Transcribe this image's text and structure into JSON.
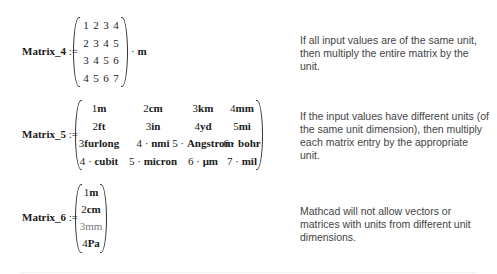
{
  "matrix4": {
    "name": "Matrix_4",
    "assign": ":=",
    "rows": [
      [
        "1",
        "2",
        "3",
        "4"
      ],
      [
        "2",
        "3",
        "4",
        "5"
      ],
      [
        "3",
        "4",
        "5",
        "6"
      ],
      [
        "4",
        "5",
        "6",
        "7"
      ]
    ],
    "suffix_op": "·",
    "suffix_unit": "m",
    "note": "If all input values are of the same unit, then multiply the entire matrix by the unit."
  },
  "matrix5": {
    "name": "Matrix_5",
    "assign": ":=",
    "rows": [
      [
        {
          "n": "1",
          "u": "m"
        },
        {
          "n": "2",
          "u": "cm"
        },
        {
          "n": "3",
          "u": "km"
        },
        {
          "n": "4",
          "u": "mm"
        }
      ],
      [
        {
          "n": "2",
          "u": "ft"
        },
        {
          "n": "3",
          "u": "in"
        },
        {
          "n": "4",
          "u": "yd"
        },
        {
          "n": "5",
          "u": "mi"
        }
      ],
      [
        {
          "n": "3",
          "u": "furlong"
        },
        {
          "n": "4 · ",
          "u": "nmi"
        },
        {
          "n": "5 · ",
          "u": "Angstrom"
        },
        {
          "n": "6 · ",
          "u": "bohr"
        }
      ],
      [
        {
          "n": "4 · ",
          "u": "cubit"
        },
        {
          "n": "5 · ",
          "u": "micron"
        },
        {
          "n": "6 · ",
          "u": "μm"
        },
        {
          "n": "7 · ",
          "u": "mil"
        }
      ]
    ],
    "note": "If the input values have different units (of the same unit dimension), then multiply each matrix entry by the appropriate unit."
  },
  "matrix6": {
    "name": "Matrix_6",
    "assign": ":=",
    "rows": [
      {
        "n": "1",
        "u": "m"
      },
      {
        "n": "2",
        "u": "cm"
      },
      {
        "n": "3",
        "u": "mm"
      },
      {
        "n": "4",
        "u": "Pa"
      }
    ],
    "note": "Mathcad will not allow vectors or matrices with units from different unit dimensions."
  }
}
